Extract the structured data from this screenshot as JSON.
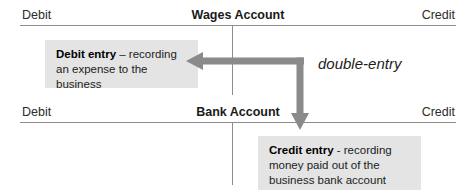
{
  "diagram": {
    "caption": "double-entry",
    "accent_gray": "#8a8a8a",
    "note_background": "#e4e4e4",
    "rule_color": "#8d8d8d",
    "accounts": [
      {
        "title": "Wages Account",
        "debit_label": "Debit",
        "credit_label": "Credit"
      },
      {
        "title": "Bank Account",
        "debit_label": "Debit",
        "credit_label": "Credit"
      }
    ],
    "notes": [
      {
        "lead": "Debit entry",
        "body": " – recording an expense to the business"
      },
      {
        "lead": "Credit entry",
        "body": " - recording money paid out of the business bank account"
      }
    ]
  }
}
